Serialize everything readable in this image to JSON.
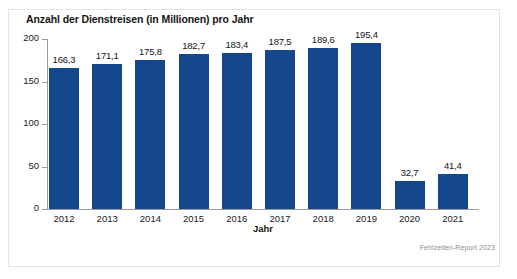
{
  "chart_data": {
    "type": "bar",
    "title": "Anzahl der Dienstreisen (in Millionen) pro Jahr",
    "xlabel": "Jahr",
    "ylabel": "",
    "categories": [
      "2012",
      "2013",
      "2014",
      "2015",
      "2016",
      "2017",
      "2018",
      "2019",
      "2020",
      "2021"
    ],
    "values": [
      166.3,
      171.1,
      175.8,
      182.7,
      183.4,
      187.5,
      189.6,
      195.4,
      32.7,
      41.4
    ],
    "value_labels": [
      "166,3",
      "171,1",
      "175,8",
      "182,7",
      "183,4",
      "187,5",
      "189,6",
      "195,4",
      "32,7",
      "41,4"
    ],
    "ylim": [
      0,
      200
    ],
    "yticks": [
      0,
      50,
      100,
      150,
      200
    ],
    "ytick_labels": [
      "0",
      "50",
      "100",
      "150",
      "200"
    ],
    "grid": false,
    "legend": false,
    "bar_color": "#15478c",
    "axis_color": "#9a9a9a",
    "frame_color": "#e2e2e2",
    "background": "#ffffff"
  },
  "source_note": "Fehlzeiten-Report 2023"
}
